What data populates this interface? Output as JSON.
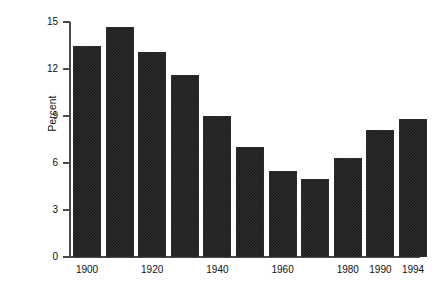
{
  "chart_data": {
    "type": "bar",
    "title": "",
    "subtitle": "",
    "xlabel": "",
    "ylabel": "Percent",
    "categories": [
      "1900",
      "1910",
      "1920",
      "1930",
      "1940",
      "1950",
      "1960",
      "1970",
      "1980",
      "1990",
      "1994"
    ],
    "values": [
      13.5,
      14.7,
      13.1,
      11.6,
      9.0,
      7.0,
      5.5,
      5.0,
      6.3,
      8.1,
      8.8
    ],
    "visible_x_tick_labels": [
      "1900",
      "1920",
      "1940",
      "1960",
      "1980",
      "1990",
      "1994"
    ],
    "x_tick_label_bar_index": [
      0,
      2,
      4,
      6,
      8,
      9,
      10
    ],
    "y_ticks": [
      0,
      3,
      6,
      9,
      12,
      15
    ],
    "y_tick_labels": [
      "0",
      "3",
      "6",
      "9",
      "12",
      "15"
    ],
    "ylim": [
      0,
      15
    ],
    "grid": false,
    "legend": false,
    "legend_position": "none",
    "bar_fill_color": "#2f2f2f",
    "axis_color": "#4a4a4a",
    "background_color": "#ffffff"
  }
}
